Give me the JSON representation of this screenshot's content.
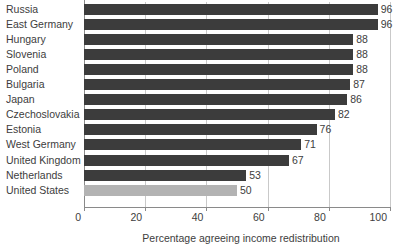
{
  "chart_data": {
    "type": "bar",
    "orientation": "horizontal",
    "title": "",
    "xlabel": "Percentage agreeing income redistribution",
    "ylabel": "",
    "xlim": [
      0,
      100
    ],
    "xticks": [
      0,
      20,
      40,
      60,
      80,
      100
    ],
    "grid": true,
    "legend": "none",
    "categories": [
      "Russia",
      "East Germany",
      "Hungary",
      "Slovenia",
      "Poland",
      "Bulgaria",
      "Japan",
      "Czechoslovakia",
      "Estonia",
      "West Germany",
      "United Kingdom",
      "Netherlands",
      "United States"
    ],
    "values": [
      96,
      96,
      88,
      88,
      88,
      87,
      86,
      82,
      76,
      71,
      67,
      53,
      50
    ],
    "bars": [
      {
        "label": "Russia",
        "value": 96,
        "value_text": "96",
        "highlight": false
      },
      {
        "label": "East Germany",
        "value": 96,
        "value_text": "96",
        "highlight": false
      },
      {
        "label": "Hungary",
        "value": 88,
        "value_text": "88",
        "highlight": false
      },
      {
        "label": "Slovenia",
        "value": 88,
        "value_text": "88",
        "highlight": false
      },
      {
        "label": "Poland",
        "value": 88,
        "value_text": "88",
        "highlight": false
      },
      {
        "label": "Bulgaria",
        "value": 87,
        "value_text": "87",
        "highlight": false
      },
      {
        "label": "Japan",
        "value": 86,
        "value_text": "86",
        "highlight": false
      },
      {
        "label": "Czechoslovakia",
        "value": 82,
        "value_text": "82",
        "highlight": false
      },
      {
        "label": "Estonia",
        "value": 76,
        "value_text": "76",
        "highlight": false
      },
      {
        "label": "West Germany",
        "value": 71,
        "value_text": "71",
        "highlight": false
      },
      {
        "label": "United Kingdom",
        "value": 67,
        "value_text": "67",
        "highlight": false
      },
      {
        "label": "Netherlands",
        "value": 53,
        "value_text": "53",
        "highlight": false
      },
      {
        "label": "United States",
        "value": 50,
        "value_text": "50",
        "highlight": true
      }
    ],
    "xtick_labels": [
      "0",
      "20",
      "40",
      "60",
      "80",
      "100"
    ],
    "colors": {
      "bar": "#3c3c3c",
      "bar_highlight": "#b3b3b3",
      "axis": "#8a8a8a",
      "gridline": "#c9c9c9",
      "text": "#3d3d3d",
      "background": "#ffffff"
    }
  }
}
